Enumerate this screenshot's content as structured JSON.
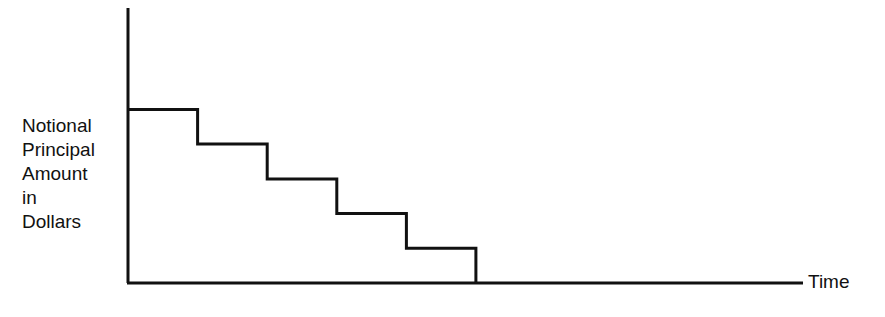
{
  "chart_data": {
    "type": "line",
    "subtype": "step",
    "title": "",
    "xlabel": "Time",
    "ylabel": "Notional Principal Amount in Dollars",
    "ylabel_lines": [
      "Notional",
      "Principal",
      "Amount",
      "in",
      "Dollars"
    ],
    "x_ticks": [],
    "y_ticks": [],
    "grid": false,
    "legend": null,
    "x": [
      0,
      1,
      2,
      3,
      4,
      5
    ],
    "values": [
      5,
      4,
      3,
      2,
      1,
      0
    ],
    "xlim": [
      0,
      9.7
    ],
    "ylim": [
      0,
      7
    ]
  },
  "colors": {
    "line": "#111111",
    "background": "#ffffff"
  }
}
